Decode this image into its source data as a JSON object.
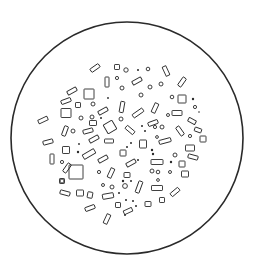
{
  "figure": {
    "stroke_color": "#2a2a2a",
    "background": "#ffffff",
    "field": {
      "cx": 127,
      "cy": 138,
      "r": 116
    },
    "rects": [
      [
        95,
        68,
        10,
        4,
        -35
      ],
      [
        117,
        67,
        5,
        5,
        0
      ],
      [
        166,
        71,
        4,
        10,
        -25
      ],
      [
        137,
        81,
        10,
        4,
        -30
      ],
      [
        107,
        82,
        4,
        10,
        0
      ],
      [
        182,
        82,
        4,
        10,
        35
      ],
      [
        72,
        91,
        10,
        4,
        -30
      ],
      [
        89,
        94,
        10,
        10,
        0
      ],
      [
        66,
        101,
        10,
        4,
        -20
      ],
      [
        78,
        105,
        5,
        5,
        0
      ],
      [
        122,
        107,
        4,
        11,
        10
      ],
      [
        182,
        99,
        8,
        8,
        0
      ],
      [
        103,
        111,
        10,
        4,
        -30
      ],
      [
        155,
        108,
        4,
        10,
        25
      ],
      [
        138,
        113,
        12,
        4,
        -35
      ],
      [
        66,
        113,
        10,
        9,
        0
      ],
      [
        177,
        113,
        10,
        5,
        0
      ],
      [
        43,
        120,
        10,
        4,
        -25
      ],
      [
        93,
        123,
        7,
        5,
        0
      ],
      [
        110,
        127,
        10,
        10,
        -30
      ],
      [
        130,
        130,
        10,
        4,
        40
      ],
      [
        153,
        123,
        10,
        4,
        -20
      ],
      [
        192,
        121,
        8,
        4,
        30
      ],
      [
        65,
        131,
        4,
        10,
        20
      ],
      [
        88,
        131,
        10,
        4,
        -15
      ],
      [
        180,
        131,
        4,
        10,
        -35
      ],
      [
        198,
        130,
        7,
        4,
        20
      ],
      [
        203,
        139,
        6,
        6,
        0
      ],
      [
        94,
        139,
        10,
        4,
        -30
      ],
      [
        109,
        141,
        9,
        4,
        0
      ],
      [
        48,
        142,
        10,
        4,
        -15
      ],
      [
        143,
        144,
        7,
        8,
        0
      ],
      [
        165,
        141,
        12,
        4,
        -15
      ],
      [
        190,
        148,
        9,
        6,
        0
      ],
      [
        66,
        150,
        7,
        7,
        0
      ],
      [
        89,
        154,
        13,
        5,
        -30
      ],
      [
        123,
        153,
        6,
        6,
        0
      ],
      [
        193,
        157,
        10,
        4,
        15
      ],
      [
        52,
        159,
        4,
        10,
        0
      ],
      [
        103,
        159,
        10,
        4,
        -30
      ],
      [
        131,
        163,
        10,
        4,
        -30
      ],
      [
        157,
        162,
        12,
        5,
        0
      ],
      [
        182,
        164,
        6,
        6,
        0
      ],
      [
        67,
        168,
        4,
        10,
        35
      ],
      [
        111,
        173,
        4,
        10,
        25
      ],
      [
        185,
        174,
        7,
        6,
        0
      ],
      [
        127,
        175,
        6,
        5,
        0
      ],
      [
        76,
        172,
        14,
        14,
        0
      ],
      [
        62,
        181,
        5,
        5,
        0
      ],
      [
        139,
        187,
        4,
        12,
        20
      ],
      [
        157,
        188,
        11,
        5,
        0
      ],
      [
        80,
        193,
        7,
        6,
        0
      ],
      [
        90,
        195,
        5,
        6,
        10
      ],
      [
        65,
        193,
        10,
        4,
        15
      ],
      [
        108,
        196,
        11,
        5,
        -10
      ],
      [
        175,
        192,
        10,
        4,
        -40
      ],
      [
        148,
        204,
        6,
        5,
        0
      ],
      [
        162,
        200,
        5,
        5,
        0
      ],
      [
        118,
        205,
        5,
        5,
        0
      ],
      [
        128,
        211,
        9,
        4,
        -25
      ],
      [
        90,
        208,
        10,
        4,
        -20
      ],
      [
        107,
        219,
        4,
        10,
        25
      ]
    ],
    "dots": [
      [
        126,
        70,
        2.2
      ],
      [
        138,
        70,
        1
      ],
      [
        148,
        69,
        1.8
      ],
      [
        117,
        78,
        1.6
      ],
      [
        150,
        87,
        2
      ],
      [
        161,
        84,
        2
      ],
      [
        122,
        88,
        2
      ],
      [
        141,
        95,
        2
      ],
      [
        172,
        97,
        1.8
      ],
      [
        108,
        98,
        0.9
      ],
      [
        93,
        104,
        2
      ],
      [
        193,
        99,
        1.2
      ],
      [
        92,
        117,
        2
      ],
      [
        81,
        118,
        2
      ],
      [
        101,
        118,
        1
      ],
      [
        195,
        107,
        1.6
      ],
      [
        121,
        119,
        2
      ],
      [
        199,
        112,
        0.8
      ],
      [
        168,
        115,
        1.5
      ],
      [
        155,
        127,
        1.6
      ],
      [
        162,
        127,
        2
      ],
      [
        142,
        126,
        1
      ],
      [
        73,
        131,
        2
      ],
      [
        145,
        131,
        1
      ],
      [
        157,
        137,
        1.4
      ],
      [
        190,
        136,
        1.6
      ],
      [
        131,
        143,
        1
      ],
      [
        127,
        147,
        1
      ],
      [
        79,
        144,
        0.9
      ],
      [
        152,
        150,
        1.2
      ],
      [
        78,
        152,
        1.2
      ],
      [
        153,
        154,
        1.2
      ],
      [
        175,
        155,
        2
      ],
      [
        171,
        162,
        1.2
      ],
      [
        138,
        160,
        1
      ],
      [
        62,
        162,
        1.6
      ],
      [
        152,
        171,
        2
      ],
      [
        158,
        172,
        1.8
      ],
      [
        170,
        172,
        1.5
      ],
      [
        99,
        172,
        1.6
      ],
      [
        123,
        181,
        1.2
      ],
      [
        158,
        180,
        1.4
      ],
      [
        62,
        181,
        2
      ],
      [
        103,
        185,
        1.5
      ],
      [
        112,
        187,
        2
      ],
      [
        125,
        186,
        2.4
      ],
      [
        131,
        181,
        1
      ],
      [
        119,
        193,
        1
      ],
      [
        126,
        200,
        1
      ],
      [
        133,
        201,
        1
      ],
      [
        136,
        206,
        1
      ],
      [
        125,
        215,
        1
      ]
    ]
  }
}
